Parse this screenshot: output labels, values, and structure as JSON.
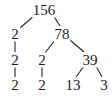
{
  "diagram": {
    "type": "factor-tree",
    "root": "156",
    "nodes": [
      {
        "id": "n156",
        "label": "156",
        "x": 44,
        "y": 10
      },
      {
        "id": "n2a",
        "label": "2",
        "x": 15,
        "y": 34
      },
      {
        "id": "n78",
        "label": "78",
        "x": 62,
        "y": 34
      },
      {
        "id": "n2b",
        "label": "2",
        "x": 15,
        "y": 60
      },
      {
        "id": "n2c",
        "label": "2",
        "x": 42,
        "y": 60
      },
      {
        "id": "n39",
        "label": "39",
        "x": 90,
        "y": 60
      },
      {
        "id": "n2d",
        "label": "2",
        "x": 15,
        "y": 85
      },
      {
        "id": "n2e",
        "label": "2",
        "x": 42,
        "y": 85
      },
      {
        "id": "n13",
        "label": "13",
        "x": 73,
        "y": 85
      },
      {
        "id": "n3",
        "label": "3",
        "x": 104,
        "y": 85
      }
    ],
    "edges": [
      {
        "from": "n156",
        "to": "n2a",
        "x1": 35,
        "y1": 15,
        "x2": 20,
        "y2": 28
      },
      {
        "from": "n156",
        "to": "n78",
        "x1": 53,
        "y1": 15,
        "x2": 60,
        "y2": 26
      },
      {
        "from": "n2a",
        "to": "n2b",
        "x1": 15,
        "y1": 41,
        "x2": 15,
        "y2": 52
      },
      {
        "from": "n78",
        "to": "n2c",
        "x1": 55,
        "y1": 40,
        "x2": 45,
        "y2": 53
      },
      {
        "from": "n78",
        "to": "n39",
        "x1": 70,
        "y1": 40,
        "x2": 84,
        "y2": 52
      },
      {
        "from": "n2b",
        "to": "n2d",
        "x1": 15,
        "y1": 67,
        "x2": 15,
        "y2": 77
      },
      {
        "from": "n2c",
        "to": "n2e",
        "x1": 42,
        "y1": 67,
        "x2": 42,
        "y2": 77
      },
      {
        "from": "n39",
        "to": "n13",
        "x1": 84,
        "y1": 66,
        "x2": 76,
        "y2": 77
      },
      {
        "from": "n39",
        "to": "n3",
        "x1": 96,
        "y1": 66,
        "x2": 102,
        "y2": 77
      }
    ]
  }
}
